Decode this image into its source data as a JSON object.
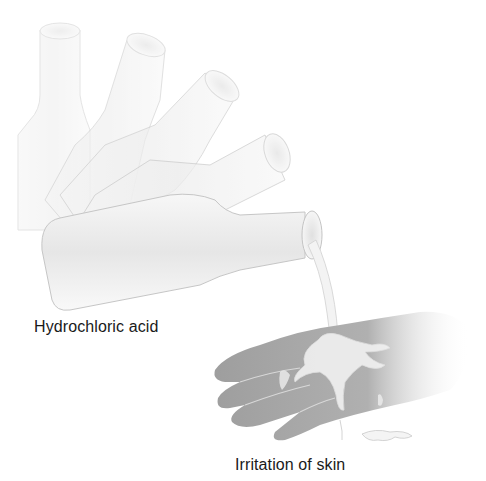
{
  "figure": {
    "labels": {
      "substance": "Hydrochloric acid",
      "effect": "Irritation of skin"
    },
    "illustration": {
      "bottles_count": 5,
      "subject": "tilting bottle pouring liquid onto hand",
      "colors": {
        "outline": "#c8c8c8",
        "bottle_fill": "#efefef",
        "hand_fill": "#a9a9a9",
        "liquid": "#f4f4f4",
        "text": "#1a1a1a"
      }
    }
  }
}
